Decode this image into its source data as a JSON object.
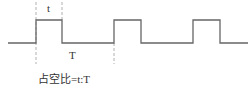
{
  "diagram": {
    "labels": {
      "pulse_width": "t",
      "period": "T",
      "caption": "占空比=t:T"
    },
    "colors": {
      "wave": "#555555",
      "guide": "#999999",
      "text": "#333333",
      "background": "#ffffff"
    },
    "waveform": {
      "low_y": 43,
      "high_y": 20,
      "start_x": 8,
      "end_x": 248,
      "pulses": [
        {
          "rise_x": 36,
          "fall_x": 62
        },
        {
          "rise_x": 114,
          "fall_x": 141
        },
        {
          "rise_x": 193,
          "fall_x": 220
        }
      ]
    },
    "guides": [
      {
        "name": "t-start",
        "x": 36
      },
      {
        "name": "t-end",
        "x": 62
      },
      {
        "name": "T-end",
        "x": 114
      }
    ]
  }
}
